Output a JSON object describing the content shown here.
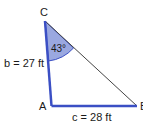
{
  "diagram": {
    "type": "triangle",
    "vertices": {
      "A": {
        "label": "A"
      },
      "B": {
        "label": "B"
      },
      "C": {
        "label": "C"
      }
    },
    "sides": {
      "b": {
        "label": "b = 27 ft"
      },
      "c": {
        "label": "c = 28 ft"
      }
    },
    "angle_C": {
      "label": "43°"
    },
    "colors": {
      "side_color": "#3b4fc4",
      "angle_fill": "#9aa8e0",
      "hypotenuse_color": "#444444"
    }
  }
}
